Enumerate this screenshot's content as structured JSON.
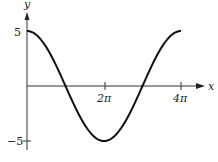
{
  "chart_data": {
    "type": "line",
    "title": "",
    "function": "y = 5 cos(x/2)",
    "xlabel": "x",
    "ylabel": "y",
    "x_ticks": [
      {
        "value": 6.2832,
        "label": "2π"
      },
      {
        "value": 12.5664,
        "label": "4π"
      }
    ],
    "y_ticks": [
      {
        "value": 5,
        "label": "5"
      },
      {
        "value": -5,
        "label": "−5"
      }
    ],
    "xlim": [
      0,
      12.5664
    ],
    "ylim": [
      -5,
      5
    ],
    "grid": false,
    "series": [
      {
        "name": "curve",
        "x": [
          0,
          1.5708,
          3.1416,
          4.7124,
          6.2832,
          7.854,
          9.4248,
          10.9956,
          12.5664
        ],
        "values": [
          5,
          3.54,
          0,
          -3.54,
          -5,
          -3.54,
          0,
          3.54,
          5
        ]
      }
    ]
  },
  "labels": {
    "x_axis": "x",
    "y_axis": "y",
    "tick_2pi": "2π",
    "tick_4pi": "4π",
    "tick_5": "5",
    "tick_neg5": "−5"
  }
}
